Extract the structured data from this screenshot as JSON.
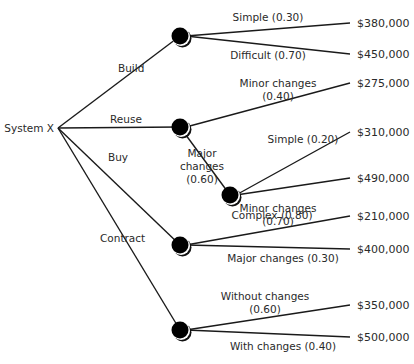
{
  "diagram": {
    "root": {
      "label": "System X",
      "x": 58,
      "y": 128
    },
    "colors": {
      "line": "#1a1a1a",
      "node": "#000000",
      "text": "#2a2a2a",
      "background": "#ffffff"
    },
    "options": [
      {
        "label": "Build",
        "label_x": 118,
        "label_y": 72,
        "node": {
          "x": 180,
          "y": 36
        }
      },
      {
        "label": "Reuse",
        "label_x": 110,
        "label_y": 123,
        "node": {
          "x": 180,
          "y": 127
        }
      },
      {
        "label": "Buy",
        "label_x": 108,
        "label_y": 161,
        "node": {
          "x": 180,
          "y": 245
        }
      },
      {
        "label": "Contract",
        "label_x": 100,
        "label_y": 242,
        "node": {
          "x": 180,
          "y": 330
        }
      }
    ],
    "chance_nodes": [
      {
        "id": "build",
        "x": 180,
        "y": 36
      },
      {
        "id": "reuse",
        "x": 180,
        "y": 127
      },
      {
        "id": "reuse-major",
        "x": 230,
        "y": 195
      },
      {
        "id": "buy",
        "x": 180,
        "y": 245
      },
      {
        "id": "contract",
        "x": 180,
        "y": 330
      }
    ],
    "outcomes": [
      {
        "from": "build",
        "label_lines": [
          "Simple (0.30)"
        ],
        "label_x": 268,
        "label_y": 21,
        "end_x": 350,
        "end_y": 23,
        "value": "$380,000",
        "value_y": 27
      },
      {
        "from": "build",
        "label_lines": [
          "Difficult (0.70)"
        ],
        "label_x": 268,
        "label_y": 59,
        "end_x": 350,
        "end_y": 54,
        "value": "$450,000",
        "value_y": 58
      },
      {
        "from": "reuse",
        "label_lines": [
          "Minor changes",
          "(0.40)"
        ],
        "label_x": 278,
        "label_y": 87,
        "end_x": 350,
        "end_y": 83,
        "value": "$275,000",
        "value_y": 87
      },
      {
        "from": "reuse-major",
        "label_lines": [
          "Simple (0.20)"
        ],
        "label_x": 303,
        "label_y": 143,
        "end_x": 350,
        "end_y": 132,
        "value": "$310,000",
        "value_y": 136
      },
      {
        "from": "reuse-major",
        "label_lines": [
          "Complex (0.80)"
        ],
        "label_x": 272,
        "label_y": 219,
        "end_x": 350,
        "end_y": 178,
        "value": "$490,000",
        "value_y": 182
      },
      {
        "from": "buy",
        "label_lines": [
          "Minor changes",
          "(0.70)"
        ],
        "label_x": 278,
        "label_y": 212,
        "end_x": 350,
        "end_y": 216,
        "value": "$210,000",
        "value_y": 220
      },
      {
        "from": "buy",
        "label_lines": [
          "Major changes (0.30)"
        ],
        "label_x": 283,
        "label_y": 262,
        "end_x": 350,
        "end_y": 249,
        "value": "$400,000",
        "value_y": 253
      },
      {
        "from": "contract",
        "label_lines": [
          "Without changes",
          "(0.60)"
        ],
        "label_x": 265,
        "label_y": 300,
        "end_x": 350,
        "end_y": 305,
        "value": "$350,000",
        "value_y": 309
      },
      {
        "from": "contract",
        "label_lines": [
          "With changes (0.40)"
        ],
        "label_x": 283,
        "label_y": 350,
        "end_x": 350,
        "end_y": 337,
        "value": "$500,000",
        "value_y": 341
      }
    ],
    "sub_branch": {
      "from": "reuse",
      "to": "reuse-major",
      "label_lines": [
        "Major",
        "changes",
        "(0.60)"
      ],
      "label_x": 202,
      "label_y": 157
    },
    "value_x": 357
  }
}
